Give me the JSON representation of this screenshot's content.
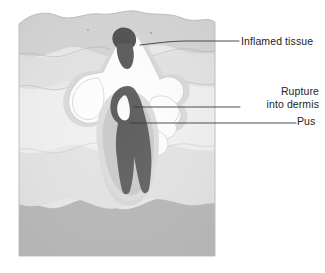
{
  "figure": {
    "type": "medical-cross-section-illustration"
  },
  "labels": {
    "inflamed_tissue": "Inflamed tissue",
    "rupture_line1": "Rupture",
    "rupture_line2": "into dermis",
    "pus": "Pus"
  },
  "colors": {
    "background": "#ffffff",
    "epidermis_top": "#cfcfcf",
    "epidermis_band": "#dcdcdc",
    "dermis_upper": "#e4e4e4",
    "dermis_mid": "#ececec",
    "dermis_light": "#f1f1f1",
    "subcutis": "#b6b6b6",
    "follicle_dark": "#5e5e5e",
    "inflamed_plug": "#4a4a4a",
    "pus_white": "#fdfdfd",
    "pus_halo": "#d8d8d8",
    "outline": "#8a8a8a",
    "leader_line": "#3a3a3a",
    "label_text": "#242424"
  },
  "leader_lines": [
    {
      "name": "inflamed-tissue-leader",
      "points": "140,44 175,41 239,41",
      "target_label": "Inflamed tissue"
    },
    {
      "name": "rupture-into-dermis-leader",
      "points": "134,107 240,107",
      "target_label": "Rupture into dermis"
    },
    {
      "name": "pus-leader",
      "points": "130,123 296,123",
      "target_label": "Pus"
    }
  ],
  "anatomy": [
    {
      "name": "skin-block",
      "label": "Skin block cross-section"
    },
    {
      "name": "epidermis-layer",
      "label": "Epidermis"
    },
    {
      "name": "dermis-layer",
      "label": "Dermis"
    },
    {
      "name": "subcutaneous-layer",
      "label": "Subcutaneous tissue"
    },
    {
      "name": "hair-follicle",
      "label": "Hair follicle"
    },
    {
      "name": "abscess-cavity",
      "label": "Pus-filled abscess cavity"
    },
    {
      "name": "inflamed-plug",
      "label": "Inflamed tissue plug at surface"
    },
    {
      "name": "rupture-pocket",
      "label": "Rupture pocket into dermis"
    }
  ]
}
